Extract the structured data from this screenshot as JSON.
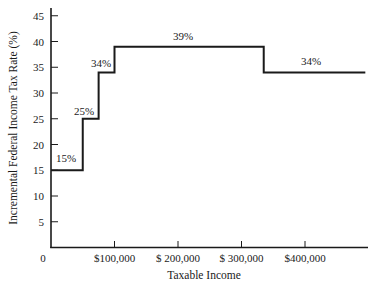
{
  "chart_data": {
    "type": "line",
    "subtype": "step",
    "title": "",
    "xlabel": "Taxable Income",
    "ylabel": "Incremental Federal Income Tax Rate (%)",
    "xlim": [
      0,
      490000
    ],
    "ylim": [
      0,
      45
    ],
    "grid": false,
    "legend": null,
    "x_ticks": [
      {
        "value": 0,
        "label": "0"
      },
      {
        "value": 100000,
        "label": "$100,000"
      },
      {
        "value": 200000,
        "label": "$ 200,000"
      },
      {
        "value": 300000,
        "label": "$ 300,000"
      },
      {
        "value": 400000,
        "label": "$400,000"
      }
    ],
    "y_ticks": [
      {
        "value": 5,
        "label": "5"
      },
      {
        "value": 10,
        "label": "10"
      },
      {
        "value": 15,
        "label": "15"
      },
      {
        "value": 20,
        "label": "20"
      },
      {
        "value": 25,
        "label": "25"
      },
      {
        "value": 30,
        "label": "30"
      },
      {
        "value": 35,
        "label": "35"
      },
      {
        "value": 40,
        "label": "40"
      },
      {
        "value": 45,
        "label": "45"
      }
    ],
    "series": [
      {
        "name": "Incremental tax rate",
        "segments": [
          {
            "x_start": 0,
            "x_end": 50000,
            "rate": 15,
            "label": "15%"
          },
          {
            "x_start": 50000,
            "x_end": 75000,
            "rate": 25,
            "label": "25%"
          },
          {
            "x_start": 75000,
            "x_end": 100000,
            "rate": 34,
            "label": "34%"
          },
          {
            "x_start": 100000,
            "x_end": 335000,
            "rate": 39,
            "label": "39%"
          },
          {
            "x_start": 335000,
            "x_end": 495000,
            "rate": 34,
            "label": "34%"
          }
        ]
      }
    ]
  }
}
